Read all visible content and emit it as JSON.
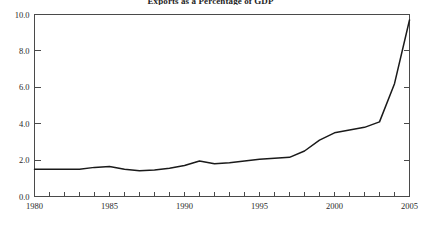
{
  "chart_data": {
    "type": "line",
    "title": "Exports as a Percentage of GDP",
    "xlabel": "",
    "ylabel": "",
    "xlim": [
      1980,
      2005
    ],
    "ylim": [
      0.0,
      10.0
    ],
    "grid": false,
    "legend": null,
    "x_major_ticks": [
      "1980",
      "1985",
      "1990",
      "1995",
      "2000",
      "2005"
    ],
    "x_major_values": [
      1980,
      1985,
      1990,
      1995,
      2000,
      2005
    ],
    "x_minor_step": 1,
    "y_ticks": [
      "0.0",
      "2.0",
      "4.0",
      "6.0",
      "8.0",
      "10.0"
    ],
    "y_tick_values": [
      0.0,
      2.0,
      4.0,
      6.0,
      8.0,
      10.0
    ],
    "line_color": "#1a1a1a",
    "axis_color": "#4a4a4a",
    "x": [
      1980,
      1981,
      1982,
      1983,
      1984,
      1985,
      1986,
      1987,
      1988,
      1989,
      1990,
      1991,
      1992,
      1993,
      1994,
      1995,
      1996,
      1997,
      1998,
      1999,
      2000,
      2001,
      2002,
      2003,
      2004,
      2005
    ],
    "values": [
      1.5,
      1.5,
      1.5,
      1.5,
      1.6,
      1.65,
      1.5,
      1.42,
      1.45,
      1.55,
      1.7,
      1.95,
      1.8,
      1.85,
      1.95,
      2.05,
      2.1,
      2.15,
      2.5,
      3.1,
      3.5,
      3.65,
      3.8,
      4.1,
      6.2,
      9.7
    ]
  },
  "figure": {
    "background_color": "#ffffff"
  }
}
